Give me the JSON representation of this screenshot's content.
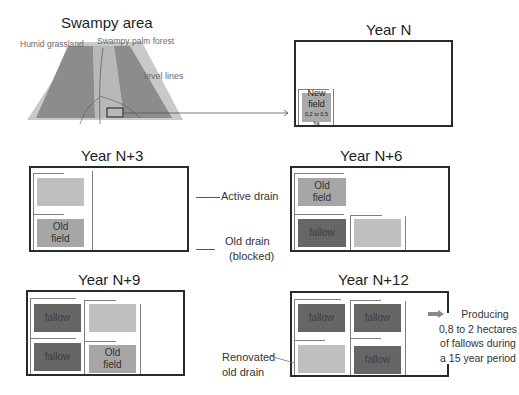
{
  "map": {
    "title": "Swampy area",
    "labels": {
      "humid_grassland": "Humid grassland",
      "swampy_palm_forest": "Swampy palm forest",
      "level_lines": "level lines"
    },
    "colors": {
      "base": "#c9c9c9",
      "strip": "#8c8c8c",
      "center": "#b4b4b4"
    }
  },
  "panels": {
    "year_n": {
      "title": "Year N",
      "new_field": {
        "label": "New field",
        "size": "0,2 to 0,5 ha"
      }
    },
    "year_n3": {
      "title": "Year N+3",
      "fields": [
        {
          "label": "",
          "type": "light"
        },
        {
          "label": "Old field",
          "type": "old"
        }
      ]
    },
    "year_n6": {
      "title": "Year N+6",
      "fields": [
        {
          "label": "Old field",
          "type": "old"
        },
        {
          "label": "fallow",
          "type": "fallow"
        },
        {
          "label": "",
          "type": "light"
        }
      ]
    },
    "year_n9": {
      "title": "Year N+9",
      "fields": [
        {
          "label": "fallow",
          "type": "fallow"
        },
        {
          "label": "",
          "type": "light"
        },
        {
          "label": "fallow",
          "type": "fallow"
        },
        {
          "label": "Old field",
          "type": "old"
        }
      ]
    },
    "year_n12": {
      "title": "Year N+12",
      "fields": [
        {
          "label": "fallow",
          "type": "fallow"
        },
        {
          "label": "fallow",
          "type": "fallow"
        },
        {
          "label": "",
          "type": "light"
        },
        {
          "label": "fallow",
          "type": "fallow"
        }
      ]
    }
  },
  "legend": {
    "active_drain": "Active drain",
    "old_drain_line1": "Old drain",
    "old_drain_line2": "(blocked)",
    "renovated_line1": "Renovated",
    "renovated_line2": "old drain"
  },
  "outcome": {
    "lines": [
      "Producing",
      "0,8 to 2 hectares",
      "of fallows during",
      "a 15 year period"
    ]
  },
  "colors": {
    "fallow": "#666666",
    "old_field": "#a6a6a6",
    "light_field": "#bfbfbf",
    "frame": "#2a2a2a",
    "drain": "#7f7f7f"
  }
}
